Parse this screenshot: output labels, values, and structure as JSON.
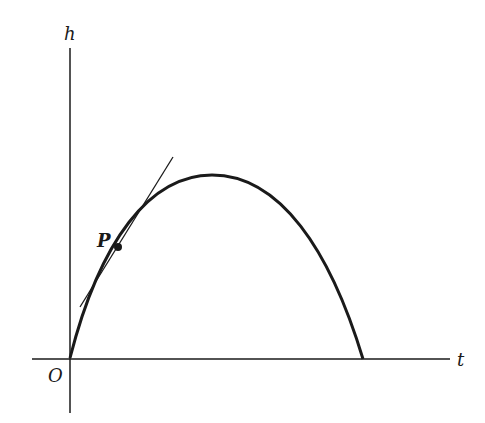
{
  "diagram": {
    "axes": {
      "y_label": "h",
      "x_label": "t",
      "origin_label": "O"
    },
    "point_label": "P",
    "curve": "parabolic trajectory of height h vs time t, starting at origin and returning to t-axis",
    "tangent": "tangent line to curve at point P",
    "colors": {
      "stroke": "#1a1a1a",
      "background": "#ffffff"
    }
  }
}
